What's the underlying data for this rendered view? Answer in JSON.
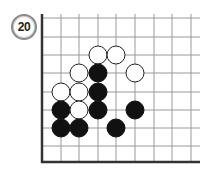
{
  "problem": {
    "number": "20"
  },
  "board": {
    "grid_x": [
      42,
      61,
      79,
      98,
      116,
      135,
      154,
      172,
      191
    ],
    "grid_y": [
      18,
      37,
      55,
      73,
      92,
      110,
      128,
      146,
      162
    ],
    "right_edge": 200,
    "top_edge": 14,
    "line_color": "#9a9a9a",
    "border_color": "#333333",
    "stone_radius": 9
  },
  "stones": [
    {
      "color": "white",
      "col": 3,
      "row": 2
    },
    {
      "color": "white",
      "col": 4,
      "row": 2
    },
    {
      "color": "white",
      "col": 2,
      "row": 3
    },
    {
      "color": "black",
      "col": 3,
      "row": 3
    },
    {
      "color": "white",
      "col": 5,
      "row": 3
    },
    {
      "color": "white",
      "col": 1,
      "row": 4
    },
    {
      "color": "white",
      "col": 2,
      "row": 4
    },
    {
      "color": "black",
      "col": 3,
      "row": 4
    },
    {
      "color": "black",
      "col": 1,
      "row": 5
    },
    {
      "color": "white",
      "col": 2,
      "row": 5
    },
    {
      "color": "black",
      "col": 3,
      "row": 5
    },
    {
      "color": "black",
      "col": 5,
      "row": 5
    },
    {
      "color": "black",
      "col": 1,
      "row": 6
    },
    {
      "color": "black",
      "col": 2,
      "row": 6
    },
    {
      "color": "black",
      "col": 4,
      "row": 6
    }
  ]
}
